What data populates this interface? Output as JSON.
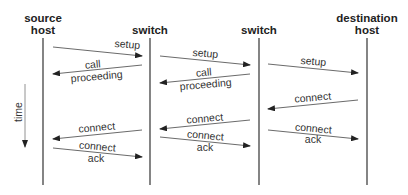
{
  "diagram": {
    "type": "sequence-diagram",
    "colors": {
      "line": "#333333",
      "text": "#333333",
      "background": "#ffffff"
    },
    "actors": [
      {
        "id": "src",
        "label_line1": "source",
        "label_line2": "host",
        "x": 43
      },
      {
        "id": "sw1",
        "label_line1": "switch",
        "label_line2": "",
        "x": 150
      },
      {
        "id": "sw2",
        "label_line1": "switch",
        "label_line2": "",
        "x": 259
      },
      {
        "id": "dst",
        "label_line1": "destination",
        "label_line2": "host",
        "x": 367
      }
    ],
    "time_axis": {
      "label": "time",
      "direction": "down"
    },
    "messages": [
      {
        "from": "src",
        "to": "sw1",
        "line1": "setup",
        "line2": ""
      },
      {
        "from": "sw1",
        "to": "src",
        "line1": "call",
        "line2": "proceeding"
      },
      {
        "from": "sw1",
        "to": "sw2",
        "line1": "setup",
        "line2": ""
      },
      {
        "from": "sw2",
        "to": "sw1",
        "line1": "call",
        "line2": "proceeding"
      },
      {
        "from": "sw2",
        "to": "dst",
        "line1": "setup",
        "line2": ""
      },
      {
        "from": "dst",
        "to": "sw2",
        "line1": "connect",
        "line2": ""
      },
      {
        "from": "sw2",
        "to": "sw1",
        "line1": "connect",
        "line2": ""
      },
      {
        "from": "sw2",
        "to": "dst",
        "line1": "connect",
        "line2": "ack"
      },
      {
        "from": "sw1",
        "to": "src",
        "line1": "connect",
        "line2": ""
      },
      {
        "from": "src",
        "to": "sw1",
        "line1": "connect",
        "line2": "ack"
      },
      {
        "from": "sw1",
        "to": "sw2",
        "line1": "connect",
        "line2": "ack"
      }
    ]
  }
}
